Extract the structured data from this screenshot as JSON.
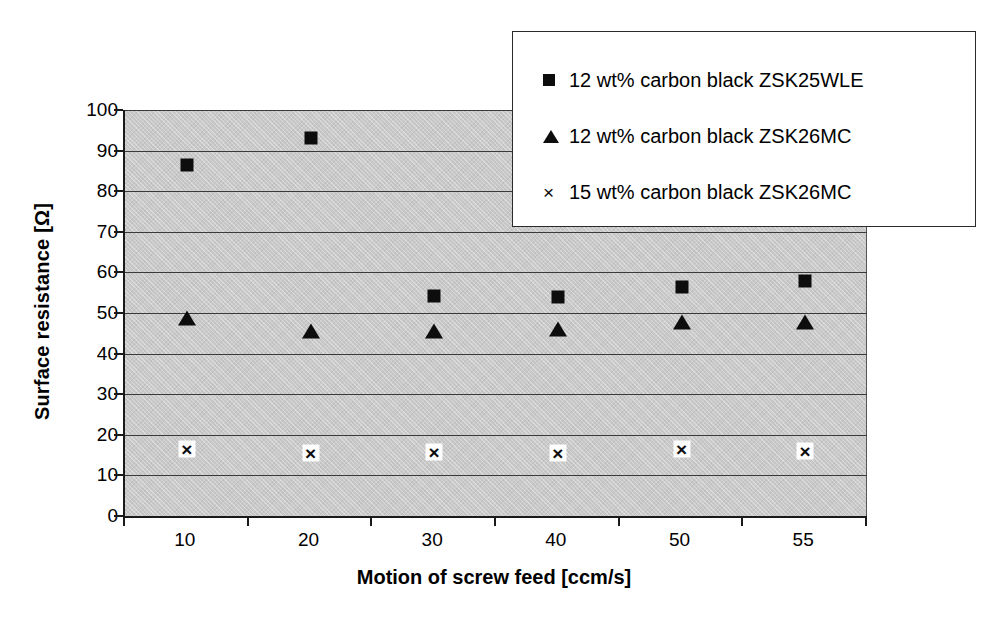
{
  "chart_data": {
    "type": "scatter",
    "title": "",
    "xlabel": "Motion of screw feed [ccm/s]",
    "ylabel": "Surface resistance [Ω]",
    "categories": [
      "10",
      "20",
      "30",
      "40",
      "50",
      "55"
    ],
    "ylim": [
      0,
      100
    ],
    "yticks": [
      0,
      10,
      20,
      30,
      40,
      50,
      60,
      70,
      80,
      90,
      100
    ],
    "ytick_labels": [
      "0",
      "10",
      "20",
      "30",
      "40",
      "50",
      "60",
      "70",
      "80",
      "90",
      "100"
    ],
    "grid": true,
    "grid_axis": "y",
    "legend_position": "top-right",
    "plot_background": "#c9c9c9",
    "marker_color": "#0d0d0d",
    "series": [
      {
        "name": "12 wt% carbon black ZSK25WLE",
        "marker": "square",
        "values": [
          86.5,
          93.0,
          54.3,
          54.0,
          56.3,
          58.0
        ]
      },
      {
        "name": "12 wt% carbon black ZSK26MC",
        "marker": "triangle",
        "values": [
          48.8,
          45.5,
          45.6,
          46.0,
          47.8,
          47.8
        ]
      },
      {
        "name": "15 wt% carbon black ZSK26MC",
        "marker": "cross",
        "values": [
          16.6,
          15.5,
          15.7,
          15.4,
          16.4,
          16.0
        ]
      }
    ]
  },
  "axes": {
    "y_title": "Surface resistance [Ω]",
    "x_title": "Motion of screw feed [ccm/s]"
  },
  "legend": {
    "entries": [
      {
        "marker": "square",
        "glyph": "■",
        "label": "12 wt% carbon black ZSK25WLE"
      },
      {
        "marker": "triangle",
        "glyph": "▲",
        "label": "12 wt% carbon black ZSK26MC"
      },
      {
        "marker": "cross",
        "glyph": "×",
        "label": "15 wt% carbon black ZSK26MC"
      }
    ]
  }
}
